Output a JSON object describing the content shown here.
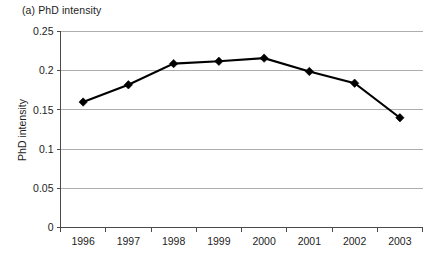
{
  "figure": {
    "title": "(a) PhD intensity"
  },
  "chart_data": {
    "type": "line",
    "title": "(a) PhD intensity",
    "xlabel": "",
    "ylabel": "PhD intensity",
    "categories": [
      "1996",
      "1997",
      "1998",
      "1999",
      "2000",
      "2001",
      "2002",
      "2003"
    ],
    "values": [
      0.16,
      0.182,
      0.209,
      0.212,
      0.216,
      0.199,
      0.184,
      0.14
    ],
    "series": [
      {
        "name": "PhD intensity",
        "values": [
          0.16,
          0.182,
          0.209,
          0.212,
          0.216,
          0.199,
          0.184,
          0.14
        ]
      }
    ],
    "ylim": [
      0,
      0.25
    ],
    "ytick_labels": [
      "0",
      "0.05",
      "0.1",
      "0.15",
      "0.2",
      "0.25"
    ],
    "ytick_values": [
      0,
      0.05,
      0.1,
      0.15,
      0.2,
      0.25
    ],
    "grid": true,
    "legend": false,
    "marker": "diamond",
    "line_color": "#000000",
    "grid_color": "#8c8c8c",
    "background": "#ffffff"
  }
}
